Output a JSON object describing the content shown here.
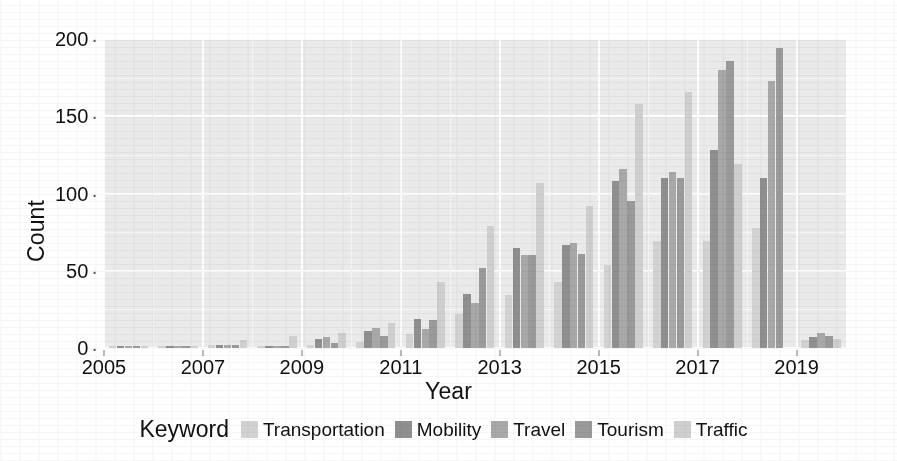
{
  "chart_data": {
    "type": "bar",
    "title": "",
    "xlabel": "Year",
    "ylabel": "Count",
    "xlim": [
      2005,
      2020
    ],
    "ylim": [
      0,
      200
    ],
    "ytick_labels": [
      "0",
      "50",
      "100",
      "150",
      "200"
    ],
    "ytick_values": [
      0,
      50,
      100,
      150,
      200
    ],
    "xtick_labels": [
      "2005",
      "2007",
      "2009",
      "2011",
      "2013",
      "2015",
      "2017",
      "2019"
    ],
    "xtick_values": [
      2005,
      2007,
      2009,
      2011,
      2013,
      2015,
      2017,
      2019
    ],
    "grid": true,
    "legend_position": "bottom",
    "legend_title": "Keyword",
    "categories": [
      2005,
      2006,
      2007,
      2008,
      2009,
      2010,
      2011,
      2012,
      2013,
      2014,
      2015,
      2016,
      2017,
      2018,
      2019
    ],
    "series": [
      {
        "name": "Transportation",
        "color": "#d2d2d2",
        "values": [
          1,
          1,
          2,
          1,
          2,
          4,
          9,
          22,
          34,
          43,
          54,
          69,
          69,
          78,
          5
        ]
      },
      {
        "name": "Mobility",
        "color": "#8f8f8f",
        "values": [
          1,
          1,
          2,
          1,
          6,
          11,
          19,
          35,
          65,
          67,
          108,
          110,
          128,
          110,
          7
        ]
      },
      {
        "name": "Travel",
        "color": "#a8a8a8",
        "values": [
          1,
          1,
          2,
          1,
          7,
          13,
          12,
          29,
          60,
          68,
          116,
          114,
          180,
          173,
          10
        ]
      },
      {
        "name": "Tourism",
        "color": "#9a9a9a",
        "values": [
          1,
          1,
          2,
          1,
          3,
          8,
          18,
          52,
          60,
          61,
          95,
          110,
          186,
          194,
          8
        ]
      },
      {
        "name": "Traffic",
        "color": "#cfcfcf",
        "values": [
          1,
          1,
          5,
          8,
          10,
          16,
          43,
          79,
          107,
          92,
          158,
          166,
          119,
          0,
          6
        ]
      }
    ]
  },
  "axis": {
    "y_title": "Count",
    "x_title": "Year"
  },
  "legend": {
    "title": "Keyword",
    "items": [
      {
        "label": "Transportation",
        "color": "#d2d2d2"
      },
      {
        "label": "Mobility",
        "color": "#8f8f8f"
      },
      {
        "label": "Travel",
        "color": "#a8a8a8"
      },
      {
        "label": "Tourism",
        "color": "#9a9a9a"
      },
      {
        "label": "Traffic",
        "color": "#cfcfcf"
      }
    ]
  },
  "panel": {
    "background_color": "#eaeaea",
    "gridline_color": "#fdfdfd"
  }
}
